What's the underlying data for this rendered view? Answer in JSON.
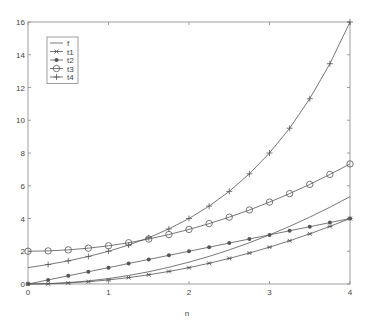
{
  "chart_data": {
    "type": "line",
    "title": "",
    "xlabel": "n",
    "ylabel": "",
    "xlim": [
      0,
      4
    ],
    "ylim": [
      0,
      16
    ],
    "xticks": [
      0,
      1,
      2,
      3,
      4
    ],
    "yticks": [
      0,
      2,
      4,
      6,
      8,
      10,
      12,
      14,
      16
    ],
    "grid": false,
    "legend_position": "upper left",
    "x": [
      0,
      0.25,
      0.5,
      0.75,
      1,
      1.25,
      1.5,
      1.75,
      2,
      2.25,
      2.5,
      2.75,
      3,
      3.25,
      3.5,
      3.75,
      4
    ],
    "series": [
      {
        "name": "f",
        "marker": "none",
        "values": [
          0,
          0.021,
          0.083,
          0.188,
          0.333,
          0.521,
          0.75,
          1.021,
          1.333,
          1.688,
          2.083,
          2.521,
          3.0,
          3.521,
          4.083,
          4.688,
          5.333
        ]
      },
      {
        "name": "t1",
        "marker": "x",
        "values": [
          0,
          0.016,
          0.063,
          0.141,
          0.25,
          0.391,
          0.563,
          0.766,
          1.0,
          1.266,
          1.563,
          1.891,
          2.25,
          2.641,
          3.063,
          3.516,
          4.0
        ]
      },
      {
        "name": "t2",
        "marker": "dot",
        "values": [
          0,
          0.25,
          0.5,
          0.75,
          1.0,
          1.25,
          1.5,
          1.75,
          2.0,
          2.25,
          2.5,
          2.75,
          3.0,
          3.25,
          3.5,
          3.75,
          4.0
        ]
      },
      {
        "name": "t3",
        "marker": "circle",
        "values": [
          2.0,
          2.021,
          2.083,
          2.188,
          2.333,
          2.521,
          2.75,
          3.021,
          3.333,
          3.688,
          4.083,
          4.521,
          5.0,
          5.521,
          6.083,
          6.688,
          7.333
        ]
      },
      {
        "name": "t4",
        "marker": "plus",
        "values": [
          1.0,
          1.189,
          1.414,
          1.682,
          2.0,
          2.378,
          2.828,
          3.364,
          4.0,
          4.757,
          5.657,
          6.727,
          8.0,
          9.514,
          11.314,
          13.454,
          16.0
        ]
      }
    ]
  },
  "colors": {
    "line": "#555555",
    "axis": "#888888",
    "text": "#444444"
  }
}
